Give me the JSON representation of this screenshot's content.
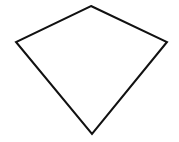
{
  "diagram": {
    "shape": "kite",
    "stroke_color": "#111111",
    "fill_color": "#ffffff",
    "stroke_width": 2,
    "vertices": [
      {
        "name": "top",
        "x": 91,
        "y": 6
      },
      {
        "name": "right",
        "x": 167,
        "y": 42
      },
      {
        "name": "bottom",
        "x": 92,
        "y": 134
      },
      {
        "name": "left",
        "x": 16,
        "y": 42
      }
    ]
  }
}
